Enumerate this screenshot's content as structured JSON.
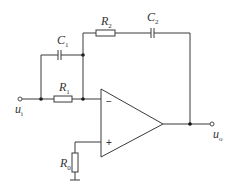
{
  "diagram": {
    "type": "op-amp circuit",
    "components": {
      "R1": {
        "symbol": "R",
        "sub": "1"
      },
      "R2": {
        "symbol": "R",
        "sub": "2"
      },
      "R0": {
        "symbol": "R",
        "sub": "0"
      },
      "C1": {
        "symbol": "C",
        "sub": "1"
      },
      "C2": {
        "symbol": "C",
        "sub": "2"
      }
    },
    "terminals": {
      "input": {
        "symbol": "u",
        "sub": "i"
      },
      "output": {
        "symbol": "u",
        "sub": "o"
      }
    },
    "opamp": {
      "inverting": "−",
      "noninverting": "+"
    }
  }
}
